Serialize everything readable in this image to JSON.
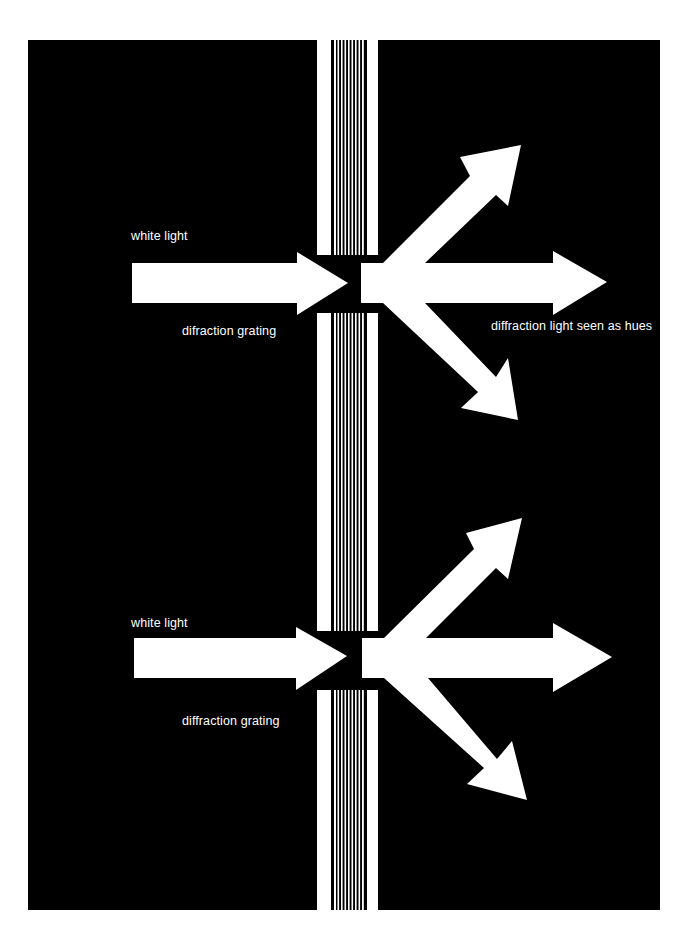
{
  "colors": {
    "page_background": "#ffffff",
    "panel": "#000000",
    "light": "#ffffff"
  },
  "panel": {
    "x": 28,
    "y": 40,
    "width": 632,
    "height": 870
  },
  "grating_column": {
    "left_bar": {
      "x": 317,
      "width": 14
    },
    "stripes": {
      "x": 333,
      "width": 32,
      "line_count": 9
    },
    "right_bar": {
      "x": 367,
      "width": 11
    }
  },
  "figures": [
    {
      "id": "top",
      "labels": {
        "input": "white light",
        "grating": "difraction grating",
        "output": "diffraction light seen as hues"
      },
      "label_positions": {
        "input": {
          "x": 131,
          "y": 229
        },
        "grating": {
          "x": 182,
          "y": 324
        },
        "output": {
          "x": 491,
          "y": 319
        }
      },
      "grating_gap": {
        "y1": 255,
        "y2": 313
      },
      "incoming_arrow": {
        "x1": 132,
        "shaft_y1": 263,
        "shaft_y2": 303,
        "head_x": 297,
        "head_y1": 252,
        "head_y2": 315,
        "tip_x": 348,
        "tip_y": 283
      },
      "outgoing_origin": {
        "x": 361,
        "y1": 263,
        "y2": 303
      },
      "outgoing_arrows": [
        {
          "direction": "up-right",
          "tip": [
            521,
            145
          ],
          "barb_a": [
            460,
            157
          ],
          "barb_b": [
            508,
            206
          ]
        },
        {
          "direction": "right",
          "tip": [
            607,
            282
          ],
          "head_x": 553,
          "head_y1": 251,
          "head_y2": 315
        },
        {
          "direction": "down-right",
          "tip": [
            518,
            420
          ],
          "barb_a": [
            508,
            358
          ],
          "barb_b": [
            461,
            408
          ]
        }
      ]
    },
    {
      "id": "bottom",
      "labels": {
        "input": "white light",
        "grating": "diffraction grating"
      },
      "label_positions": {
        "input": {
          "x": 131,
          "y": 616
        },
        "grating": {
          "x": 182,
          "y": 714
        }
      },
      "grating_gap": {
        "y1": 631,
        "y2": 690
      },
      "incoming_arrow": {
        "x1": 134,
        "shaft_y1": 638,
        "shaft_y2": 678,
        "head_x": 296,
        "head_y1": 627,
        "head_y2": 690,
        "tip_x": 347,
        "tip_y": 656
      },
      "outgoing_origin": {
        "x": 362,
        "y1": 638,
        "y2": 678
      },
      "outgoing_arrows": [
        {
          "direction": "up-right",
          "tip": [
            522,
            518
          ],
          "barb_a": [
            466,
            533
          ],
          "barb_b": [
            508,
            579
          ]
        },
        {
          "direction": "right",
          "tip": [
            612,
            657
          ],
          "head_x": 553,
          "head_y1": 623,
          "head_y2": 692
        },
        {
          "direction": "down-right",
          "tip": [
            527,
            800
          ],
          "barb_a": [
            512,
            741
          ],
          "barb_b": [
            467,
            784
          ]
        }
      ]
    }
  ]
}
